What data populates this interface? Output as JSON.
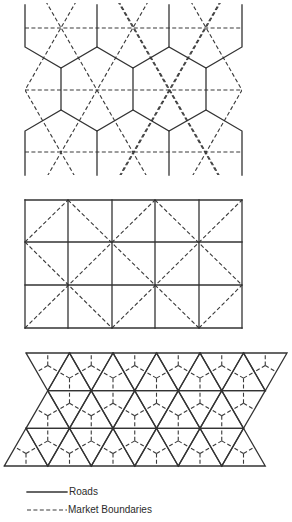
{
  "diagram": {
    "type": "market-area-patterns",
    "colors": {
      "line": "#333333",
      "background": "#ffffff"
    },
    "panels": [
      {
        "id": "hexagonal-roads",
        "description": "Hexagonal road network with triangular market boundaries",
        "hex_road_polylines": [
          [
            [
              25,
              5
            ],
            [
              25,
              47
            ],
            [
              61,
              68
            ],
            [
              97,
              47
            ],
            [
              133,
              68
            ],
            [
              169,
              47
            ],
            [
              206,
              68
            ],
            [
              242,
              47
            ],
            [
              242,
              5
            ]
          ],
          [
            [
              97,
              5
            ],
            [
              97,
              47
            ]
          ],
          [
            [
              169,
              5
            ],
            [
              169,
              47
            ]
          ],
          [
            [
              61,
              68
            ],
            [
              61,
              110
            ]
          ],
          [
            [
              133,
              68
            ],
            [
              133,
              110
            ]
          ],
          [
            [
              206,
              68
            ],
            [
              206,
              110
            ]
          ],
          [
            [
              25,
              175
            ],
            [
              25,
              131
            ],
            [
              61,
              110
            ],
            [
              97,
              131
            ],
            [
              133,
              110
            ],
            [
              169,
              131
            ],
            [
              206,
              110
            ],
            [
              242,
              131
            ],
            [
              242,
              175
            ]
          ],
          [
            [
              97,
              131
            ],
            [
              97,
              175
            ]
          ],
          [
            [
              169,
              131
            ],
            [
              169,
              175
            ]
          ]
        ],
        "market_horizontal_y": [
          28,
          90,
          152
        ],
        "market_x_range": [
          25,
          242
        ],
        "market_y_range": [
          3,
          175
        ],
        "market_centers": [
          [
            61,
            28
          ],
          [
            133,
            28
          ],
          [
            206,
            28
          ],
          [
            25,
            90
          ],
          [
            97,
            90
          ],
          [
            169,
            90
          ],
          [
            242,
            90
          ],
          [
            61,
            152
          ],
          [
            133,
            152
          ],
          [
            206,
            152
          ]
        ]
      },
      {
        "id": "square-roads",
        "description": "Square grid road network with diagonal market boundaries",
        "columns_x": [
          25,
          68,
          112,
          155,
          199,
          242
        ],
        "rows_y": [
          200,
          242,
          285,
          328
        ],
        "market_segments": [
          [
            [
              25,
              242
            ],
            [
              68,
              200
            ]
          ],
          [
            [
              68,
              200
            ],
            [
              199,
              328
            ]
          ],
          [
            [
              25,
              242
            ],
            [
              112,
              328
            ]
          ],
          [
            [
              25,
              328
            ],
            [
              155,
              200
            ]
          ],
          [
            [
              112,
              328
            ],
            [
              242,
              200
            ]
          ],
          [
            [
              155,
              200
            ],
            [
              242,
              285
            ]
          ],
          [
            [
              199,
              328
            ],
            [
              242,
              285
            ]
          ]
        ]
      },
      {
        "id": "triangular-roads",
        "description": "Triangular road network with hexagonal market boundaries",
        "spacing": 43.5,
        "rows": [
          {
            "y": 353,
            "x_start": 26,
            "count": 7
          },
          {
            "y": 390.7,
            "x_start": 47.75,
            "count": 6
          },
          {
            "y": 428.3,
            "x_start": 26,
            "count": 6
          },
          {
            "y": 466,
            "x_start": 4.25,
            "count": 7
          }
        ]
      }
    ]
  },
  "legend": {
    "items": [
      {
        "label": "Roads",
        "style": "solid"
      },
      {
        "label": "Market Boundaries",
        "style": "dashed"
      }
    ]
  }
}
